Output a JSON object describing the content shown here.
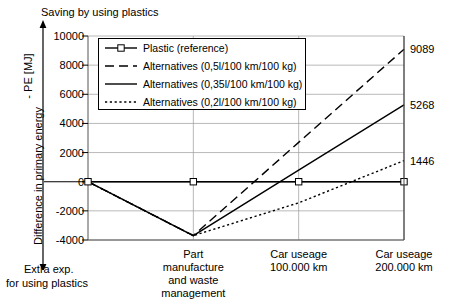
{
  "annotations": {
    "top_note": "Saving by using plastics",
    "bottom_note_line1": "Extra exp.",
    "bottom_note_line2": "for using plastics",
    "y_axis_label_main": "Difference in primary energy",
    "y_axis_label_unit": "- PE [MJ]"
  },
  "chart_data": {
    "type": "line",
    "title": "",
    "xlabel": "",
    "ylabel": "Difference in primary energy  - PE [MJ]",
    "ylim": [
      -4000,
      10000
    ],
    "yticks": [
      10000,
      8000,
      6000,
      4000,
      2000,
      0,
      -2000,
      -4000
    ],
    "ytick_labels": [
      "10000",
      "8000",
      "6000",
      "4000",
      "2000",
      "0",
      "-2000",
      "-4000"
    ],
    "grid": true,
    "legend_position": "upper-left-inside",
    "categories": [
      "",
      "Part manufacture and waste management",
      "Car useage 100.000 km",
      "Car useage 200.000 km"
    ],
    "category_labels": [
      {
        "line1": "",
        "line2": "",
        "line3": "",
        "line4": ""
      },
      {
        "line1": "Part",
        "line2": "manufacture",
        "line3": "and waste",
        "line4": "management"
      },
      {
        "line1": "Car useage",
        "line2": "100.000 km",
        "line3": "",
        "line4": ""
      },
      {
        "line1": "Car useage",
        "line2": "200.000 km",
        "line3": "",
        "line4": ""
      }
    ],
    "series": [
      {
        "name": "Plastic (reference)",
        "style": "solid-markers",
        "values": [
          0,
          0,
          0,
          0
        ],
        "end_label": ""
      },
      {
        "name": "Alternatives (0,5l/100 km/100 kg)",
        "style": "dashed",
        "values": [
          0,
          -3700,
          2700,
          9089
        ],
        "end_label": "9089"
      },
      {
        "name": "Alternatives (0,35l/100 km/100 kg)",
        "style": "solid",
        "values": [
          0,
          -3700,
          800,
          5268
        ],
        "end_label": "5268"
      },
      {
        "name": "Alternatives (0,2l/100 km/100 kg)",
        "style": "dotted",
        "values": [
          0,
          -3700,
          -1450,
          1446
        ],
        "end_label": "1446"
      }
    ],
    "end_labels": [
      "9089",
      "5268",
      "1446"
    ]
  },
  "colors": {
    "line": "#000000",
    "grid": "#999999",
    "background": "#ffffff"
  }
}
